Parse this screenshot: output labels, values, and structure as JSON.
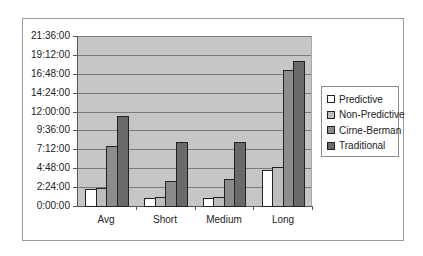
{
  "chart_data": {
    "type": "bar",
    "title": "",
    "xlabel": "",
    "ylabel": "",
    "categories": [
      "Avg",
      "Short",
      "Medium",
      "Long"
    ],
    "y_unit": "hours (h:mm:ss)",
    "ylim": [
      0,
      21.6
    ],
    "y_ticks": [
      "0:00:00",
      "2:24:00",
      "4:48:00",
      "7:12:00",
      "9:36:00",
      "12:00:00",
      "14:24:00",
      "16:48:00",
      "19:12:00",
      "21:36:00"
    ],
    "grid": true,
    "legend_position": "right",
    "series": [
      {
        "name": "Predictive",
        "color": "#ffffff",
        "values": [
          2.15,
          1.0,
          1.0,
          4.6
        ]
      },
      {
        "name": "Non-Predictive",
        "color": "#bdbdbd",
        "values": [
          2.3,
          1.1,
          1.1,
          4.95
        ]
      },
      {
        "name": "Cirne-Berman",
        "color": "#8c8c8c",
        "values": [
          7.6,
          3.2,
          3.45,
          17.25
        ]
      },
      {
        "name": "Traditional",
        "color": "#6a6a6a",
        "values": [
          11.45,
          8.15,
          8.1,
          18.4
        ]
      }
    ]
  }
}
